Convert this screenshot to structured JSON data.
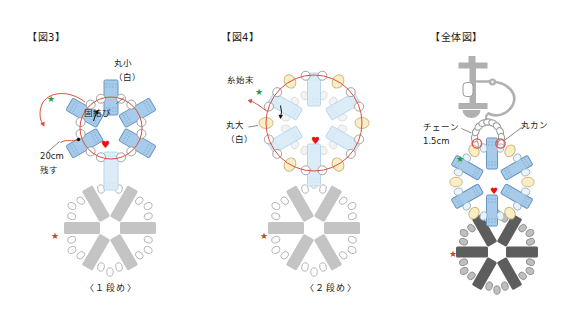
{
  "figures": {
    "fig3": {
      "title": "【図3】",
      "bead_label": "丸小\n（白）",
      "knot_label": "固結び",
      "tail_label": "20cm\n残す",
      "caption": "〈１段め〉"
    },
    "fig4": {
      "title": "【図4】",
      "thread_end_label": "糸始末",
      "bead_label": "丸大\n（白）",
      "caption": "〈２段め〉"
    },
    "overall": {
      "title": "【全体図】",
      "chain_label": "チェーン\n1.5cm",
      "jump_ring_label": "丸カン"
    }
  },
  "markers": {
    "star_glyph": "★",
    "heart_glyph": "♥",
    "colors": {
      "green_star": "#1f9e3e",
      "red_star": "#e8342a",
      "heart": "#e8120f"
    }
  },
  "palette": {
    "blue_fill": "#a6cbeb",
    "blue_stroke": "#6a94bd",
    "blue_dash": "#7aa3c8",
    "faded_fill": "#dcedf8",
    "faded_stroke": "#b9d7ea",
    "faded_dash": "#c6ddee",
    "thread_red": "#d94f40",
    "bead_white_stroke": "#999999",
    "yellow_fill": "#faeec6",
    "yellow_stroke": "#c9b274",
    "pale_blue_fill": "#eaf3fa",
    "pale_blue_stroke": "#9db5c6",
    "gray_bead": "#c4c4c4",
    "gray_oval_stroke": "#b0b0b0",
    "dark_bead": "#5d5d5d",
    "dark_oval_fill": "#bfbfbf",
    "dark_oval_stroke": "#8d8d8d",
    "metal_gray": "#b0b0b0",
    "chain_stroke": "#999999",
    "ring_red": "#e05555",
    "pointer": "#555555",
    "ink": "#111111"
  }
}
